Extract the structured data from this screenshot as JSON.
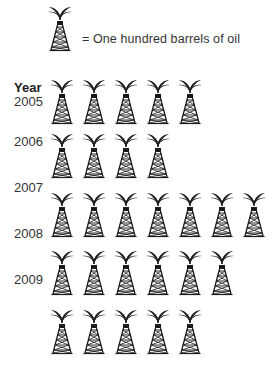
{
  "legend": {
    "icon": "oil-derrick-icon",
    "text": "= One hundred barrels of oil",
    "unit_value": 100
  },
  "axis": {
    "header": "Year"
  },
  "year_labels": [
    "2005",
    "2006",
    "2007",
    "2008",
    "2009"
  ],
  "colors": {
    "icon": "#1a1a1a",
    "text": "#333333",
    "background": "#ffffff"
  },
  "chart_data": {
    "type": "pictograph",
    "title": "",
    "legend": "= One hundred barrels of oil",
    "icon_value": 100,
    "ylabel": "Year",
    "categories": [
      "2005",
      "2006",
      "2007",
      "2008",
      "2009"
    ],
    "rows_icon_counts": [
      5,
      4,
      7,
      6,
      5
    ],
    "note": "Year labels are visually offset from icon rows; there are 5 icon rows and 5 year labels",
    "values": [
      500,
      400,
      700,
      600,
      500
    ]
  }
}
